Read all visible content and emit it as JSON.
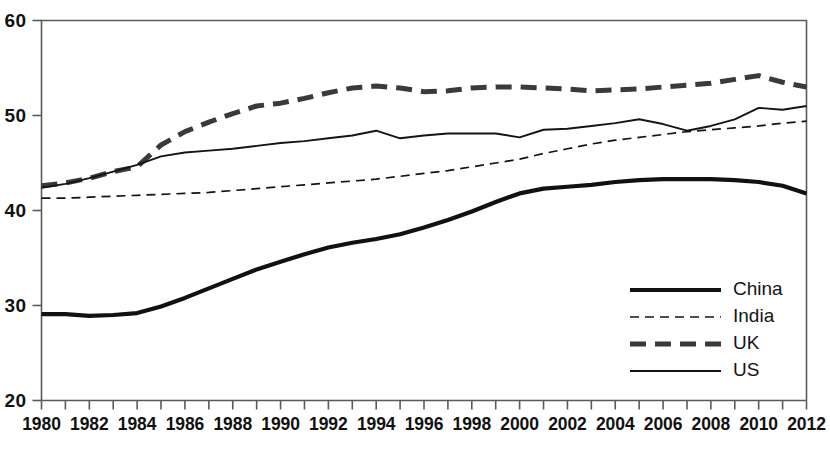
{
  "chart_data": {
    "type": "line",
    "title": "",
    "xlabel": "",
    "ylabel": "",
    "xlim": [
      1980,
      2012
    ],
    "ylim": [
      20,
      60
    ],
    "grid": false,
    "legend_position": "bottom-right",
    "x": [
      1980,
      1981,
      1982,
      1983,
      1984,
      1985,
      1986,
      1987,
      1988,
      1989,
      1990,
      1991,
      1992,
      1993,
      1994,
      1995,
      1996,
      1997,
      1998,
      1999,
      2000,
      2001,
      2002,
      2003,
      2004,
      2005,
      2006,
      2007,
      2008,
      2009,
      2010,
      2011,
      2012
    ],
    "xticks": [
      1980,
      1981,
      1982,
      1983,
      1984,
      1985,
      1986,
      1987,
      1988,
      1989,
      1990,
      1991,
      1992,
      1993,
      1994,
      1995,
      1996,
      1997,
      1998,
      1999,
      2000,
      2001,
      2002,
      2003,
      2004,
      2005,
      2006,
      2007,
      2008,
      2009,
      2010,
      2011,
      2012
    ],
    "xtick_labels": [
      "1980",
      "1982",
      "1984",
      "1986",
      "1988",
      "1990",
      "1992",
      "1994",
      "1996",
      "1998",
      "2000",
      "2002",
      "2004",
      "2006",
      "2008",
      "2010",
      "2012"
    ],
    "xtick_label_values": [
      1980,
      1982,
      1984,
      1986,
      1988,
      1990,
      1992,
      1994,
      1996,
      1998,
      2000,
      2002,
      2004,
      2006,
      2008,
      2010,
      2012
    ],
    "yticks": [
      20,
      30,
      40,
      50,
      60
    ],
    "ytick_labels": [
      "20",
      "30",
      "40",
      "50",
      "60"
    ],
    "series": [
      {
        "name": "China",
        "style": "thick-solid",
        "color": "#111111",
        "width": 4.2,
        "dash": "none",
        "values": [
          29.1,
          29.1,
          28.9,
          29.0,
          29.2,
          29.9,
          30.8,
          31.8,
          32.8,
          33.8,
          34.6,
          35.4,
          36.1,
          36.6,
          37.0,
          37.5,
          38.2,
          39.0,
          39.9,
          40.9,
          41.8,
          42.3,
          42.5,
          42.7,
          43.0,
          43.2,
          43.3,
          43.3,
          43.3,
          43.2,
          43.0,
          42.6,
          41.8
        ]
      },
      {
        "name": "India",
        "style": "thin-dashed",
        "color": "#141414",
        "width": 1.7,
        "dash": "9,6",
        "values": [
          41.3,
          41.3,
          41.4,
          41.5,
          41.6,
          41.7,
          41.8,
          41.9,
          42.1,
          42.3,
          42.5,
          42.7,
          42.9,
          43.1,
          43.3,
          43.6,
          43.9,
          44.2,
          44.6,
          45.0,
          45.4,
          46.0,
          46.5,
          47.0,
          47.4,
          47.7,
          48.0,
          48.3,
          48.5,
          48.7,
          48.9,
          49.2,
          49.4
        ]
      },
      {
        "name": "UK",
        "style": "thick-dashed",
        "color": "#3a3a3a",
        "width": 5.0,
        "dash": "16,9",
        "values": [
          42.6,
          42.9,
          43.4,
          44.1,
          44.6,
          46.9,
          48.3,
          49.3,
          50.2,
          51.0,
          51.3,
          51.8,
          52.4,
          52.9,
          53.1,
          52.9,
          52.5,
          52.6,
          52.9,
          53.0,
          53.0,
          52.9,
          52.8,
          52.6,
          52.7,
          52.8,
          53.0,
          53.2,
          53.4,
          53.8,
          54.2,
          53.5,
          53.0
        ]
      },
      {
        "name": "US",
        "style": "thin-solid",
        "color": "#141414",
        "width": 1.9,
        "dash": "none",
        "values": [
          42.4,
          42.8,
          43.4,
          44.1,
          44.8,
          45.7,
          46.1,
          46.3,
          46.5,
          46.8,
          47.1,
          47.3,
          47.6,
          47.9,
          48.4,
          47.6,
          47.9,
          48.1,
          48.1,
          48.1,
          47.7,
          48.5,
          48.6,
          48.9,
          49.2,
          49.6,
          49.1,
          48.4,
          48.9,
          49.6,
          50.8,
          50.6,
          51.0
        ]
      }
    ]
  },
  "legend": {
    "items": [
      {
        "label": "China"
      },
      {
        "label": "India"
      },
      {
        "label": "UK"
      },
      {
        "label": "US"
      }
    ]
  },
  "axes": {
    "frame_color": "#5a5a5a",
    "background": "#ffffff"
  }
}
